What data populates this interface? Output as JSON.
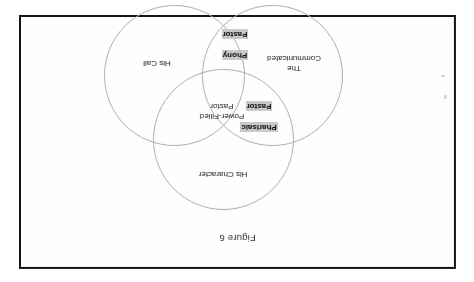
{
  "page": {
    "orientation_degrees": 180,
    "background_color": "#ffffff",
    "border_color": "#151515"
  },
  "figure": {
    "caption": "Figure 6",
    "type": "venn-3-circle"
  },
  "venn": {
    "circle_stroke_color": "#adadad",
    "highlight_color": "#c9c9c9",
    "sets": [
      {
        "id": "character",
        "label": "His Character",
        "position": "top"
      },
      {
        "id": "communicated",
        "label": "The\nCommunicated",
        "position": "bottom-left"
      },
      {
        "id": "call",
        "label": "His Call",
        "position": "bottom-right"
      }
    ],
    "intersections": [
      {
        "id": "pharisaic",
        "label_line1": "Pharisaic",
        "label_line2": "Pastor",
        "sets": [
          "character",
          "communicated"
        ],
        "highlighted": true
      },
      {
        "id": "phony",
        "label_line1": "Phony",
        "label_line2": "Pastor",
        "sets": [
          "communicated",
          "call"
        ],
        "highlighted": true
      }
    ],
    "center": {
      "id": "power-filled",
      "label": "Power-Filled\nPastor",
      "sets": [
        "character",
        "communicated",
        "call"
      ],
      "highlighted": false
    }
  }
}
